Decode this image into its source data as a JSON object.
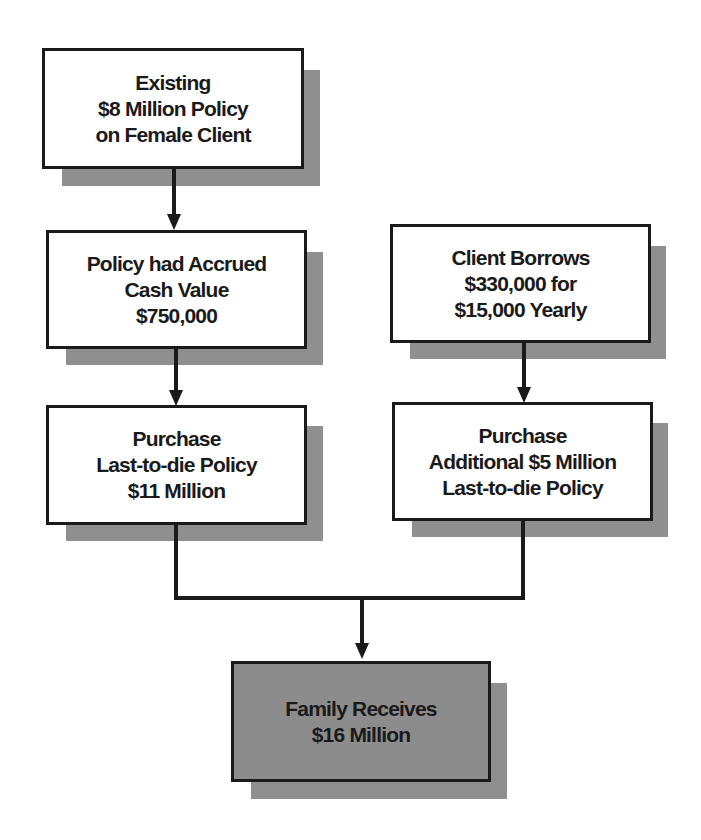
{
  "diagram": {
    "type": "flowchart",
    "nodes": [
      {
        "id": "existing_policy",
        "lines": [
          "Existing",
          "$8 Million Policy",
          "on Female Client"
        ]
      },
      {
        "id": "cash_value",
        "lines": [
          "Policy had Accrued",
          "Cash Value",
          "$750,000"
        ]
      },
      {
        "id": "client_borrows",
        "lines": [
          "Client  Borrows",
          "$330,000 for",
          "$15,000 Yearly"
        ]
      },
      {
        "id": "purchase_11m",
        "lines": [
          "Purchase",
          "Last-to-die Policy",
          "$11 Million"
        ]
      },
      {
        "id": "purchase_5m",
        "lines": [
          "Purchase",
          "Additional $5 Million",
          "Last-to-die Policy"
        ]
      },
      {
        "id": "family_receives",
        "lines": [
          "Family Receives",
          "$16 Million"
        ]
      }
    ],
    "edges": [
      {
        "from": "existing_policy",
        "to": "cash_value"
      },
      {
        "from": "cash_value",
        "to": "purchase_11m"
      },
      {
        "from": "client_borrows",
        "to": "purchase_5m"
      },
      {
        "from": "purchase_11m",
        "to": "family_receives"
      },
      {
        "from": "purchase_5m",
        "to": "family_receives"
      }
    ],
    "colors": {
      "box_fill": "#ffffff",
      "final_box_fill": "#8c8c8c",
      "shadow": "#8f8f8f",
      "stroke": "#1a1a1a"
    }
  }
}
